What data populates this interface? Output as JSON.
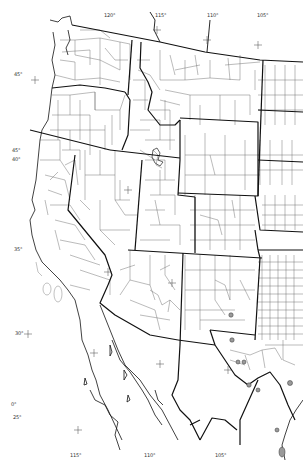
{
  "map": {
    "title": "",
    "region": "Western United States and northwestern Mexico",
    "style": "black outline county/state boundary map",
    "colors": {
      "background": "#ffffff",
      "state_border": "#111111",
      "county_border": "#555555",
      "marker_fill": "#9a9a9a",
      "marker_stroke": "#333333"
    },
    "longitude_labels": [
      {
        "text": "120°",
        "x": 108,
        "y": 17
      },
      {
        "text": "115°",
        "x": 158,
        "y": 17
      },
      {
        "text": "110°",
        "x": 208,
        "y": 17
      },
      {
        "text": "105°",
        "x": 259,
        "y": 17
      },
      {
        "text": "115°",
        "x": 73,
        "y": 457
      },
      {
        "text": "110°",
        "x": 147,
        "y": 457
      },
      {
        "text": "105°",
        "x": 218,
        "y": 457
      }
    ],
    "latitude_labels": [
      {
        "text": "45°",
        "x": 15,
        "y": 76
      },
      {
        "text": "45°",
        "x": 13,
        "y": 152
      },
      {
        "text": "40°",
        "x": 13,
        "y": 160
      },
      {
        "text": "35°",
        "x": 15,
        "y": 250
      },
      {
        "text": "30°",
        "x": 17,
        "y": 334
      },
      {
        "text": "0°",
        "x": 12,
        "y": 405
      },
      {
        "text": "25°",
        "x": 14,
        "y": 418
      }
    ],
    "graticule_crosses": [
      {
        "x": 35,
        "y": 80
      },
      {
        "x": 157,
        "y": 30
      },
      {
        "x": 207,
        "y": 40
      },
      {
        "x": 258,
        "y": 45
      },
      {
        "x": 128,
        "y": 190
      },
      {
        "x": 108,
        "y": 272
      },
      {
        "x": 172,
        "y": 283
      },
      {
        "x": 28,
        "y": 334
      },
      {
        "x": 94,
        "y": 353
      },
      {
        "x": 160,
        "y": 364
      },
      {
        "x": 78,
        "y": 430
      },
      {
        "x": 228,
        "y": 370
      }
    ],
    "markers": [
      {
        "x": 231,
        "y": 315,
        "r": 2.2
      },
      {
        "x": 232,
        "y": 340,
        "r": 2.2
      },
      {
        "x": 238,
        "y": 362,
        "r": 2
      },
      {
        "x": 244,
        "y": 362,
        "r": 2
      },
      {
        "x": 249,
        "y": 385,
        "r": 2.2
      },
      {
        "x": 258,
        "y": 390,
        "r": 2
      },
      {
        "x": 290,
        "y": 383,
        "r": 2.5
      },
      {
        "x": 277,
        "y": 430,
        "r": 2
      },
      {
        "x": 282,
        "y": 452,
        "r": 3.5
      }
    ],
    "island_label": "",
    "marker_legend": ""
  }
}
